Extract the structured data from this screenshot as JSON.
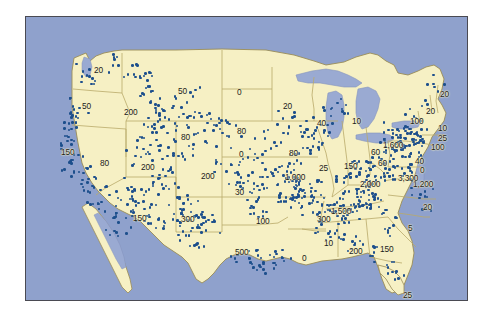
{
  "figure": {
    "type": "dot-distribution-map",
    "region": "Contiguous United States",
    "title": "",
    "dot_symbol_label": "",
    "colors": {
      "land": "#f6f0c4",
      "water": "#8fa1cc",
      "lake": "#9aaad2",
      "state_border": "#b9a96a",
      "coast_outline": "#9a8c57",
      "dot": "#1d4f8c",
      "frame": "#4a4a52",
      "background": "#ffffff"
    }
  },
  "chart_data": {
    "type": "map",
    "title": "",
    "xlabel": "",
    "ylabel": "",
    "legend": [],
    "grid": false,
    "categories": [
      "WA",
      "OR",
      "CA",
      "ID",
      "NV",
      "MT",
      "WY",
      "UT",
      "CO",
      "AZ",
      "NM",
      "ND",
      "SD",
      "NE",
      "KS",
      "OK",
      "TX",
      "MN",
      "IA",
      "MO",
      "AR",
      "LA",
      "WI",
      "IL",
      "MI",
      "IN",
      "OH",
      "KY",
      "TN",
      "MS",
      "AL",
      "GA",
      "FL",
      "SC",
      "NC",
      "VA",
      "WV",
      "PA",
      "NY",
      "ME",
      "VT-NH",
      "MA",
      "CT-RI",
      "NJ",
      "MD-DE"
    ],
    "values": [
      20,
      50,
      150,
      200,
      80,
      50,
      80,
      200,
      200,
      150,
      300,
      0,
      80,
      0,
      30,
      100,
      500,
      20,
      80,
      1000,
      300,
      0,
      40,
      150,
      10,
      60,
      60,
      1000,
      1500,
      10,
      200,
      150,
      25,
      5,
      1200,
      1200,
      1600,
      3300,
      2000,
      20,
      20,
      25,
      100,
      100,
      40
    ],
    "note": "Values are the printed per-state counts as rendered on the map."
  },
  "map_labels": [
    {
      "id": "label-wa",
      "text": "20",
      "x": 68,
      "y": 49
    },
    {
      "id": "label-or",
      "text": "50",
      "x": 56,
      "y": 85
    },
    {
      "id": "label-ca",
      "text": "150",
      "x": 35,
      "y": 131
    },
    {
      "id": "label-id",
      "text": "200",
      "x": 98,
      "y": 91
    },
    {
      "id": "label-mt",
      "text": "50",
      "x": 152,
      "y": 70
    },
    {
      "id": "label-nd",
      "text": "0",
      "x": 211,
      "y": 71
    },
    {
      "id": "label-wy",
      "text": "80",
      "x": 155,
      "y": 116
    },
    {
      "id": "label-sd",
      "text": "80",
      "x": 211,
      "y": 110
    },
    {
      "id": "label-ne",
      "text": "0",
      "x": 213,
      "y": 133
    },
    {
      "id": "label-nv",
      "text": "80",
      "x": 74,
      "y": 142
    },
    {
      "id": "label-ut",
      "text": "200",
      "x": 115,
      "y": 146
    },
    {
      "id": "label-co",
      "text": "200",
      "x": 175,
      "y": 155
    },
    {
      "id": "label-ks",
      "text": "30",
      "x": 209,
      "y": 171
    },
    {
      "id": "label-ok",
      "text": "100",
      "x": 230,
      "y": 200
    },
    {
      "id": "label-tx",
      "text": "500",
      "x": 209,
      "y": 231
    },
    {
      "id": "label-az",
      "text": "150",
      "x": 107,
      "y": 197
    },
    {
      "id": "label-nm",
      "text": "300",
      "x": 155,
      "y": 198
    },
    {
      "id": "label-mn",
      "text": "20",
      "x": 257,
      "y": 85
    },
    {
      "id": "label-wi",
      "text": "40",
      "x": 291,
      "y": 102
    },
    {
      "id": "label-mi",
      "text": "10",
      "x": 326,
      "y": 100
    },
    {
      "id": "label-ia",
      "text": "80",
      "x": 263,
      "y": 132
    },
    {
      "id": "label-mo",
      "text": "1,000",
      "x": 259,
      "y": 156
    },
    {
      "id": "label-il",
      "text": "150",
      "x": 318,
      "y": 145
    },
    {
      "id": "label-in",
      "text": "25",
      "x": 293,
      "y": 147
    },
    {
      "id": "label-oh",
      "text": "60",
      "x": 352,
      "y": 142
    },
    {
      "id": "label-ky",
      "text": "2,000",
      "x": 334,
      "y": 163
    },
    {
      "id": "label-tn",
      "text": "1,500",
      "x": 305,
      "y": 190
    },
    {
      "id": "label-ar",
      "text": "300",
      "x": 291,
      "y": 198
    },
    {
      "id": "label-la",
      "text": "0",
      "x": 276,
      "y": 237
    },
    {
      "id": "label-ms",
      "text": "10",
      "x": 298,
      "y": 222
    },
    {
      "id": "label-al",
      "text": "200",
      "x": 323,
      "y": 230
    },
    {
      "id": "label-ga",
      "text": "150",
      "x": 354,
      "y": 228
    },
    {
      "id": "label-sc",
      "text": "5",
      "x": 382,
      "y": 207
    },
    {
      "id": "label-fl",
      "text": "25",
      "x": 377,
      "y": 274
    },
    {
      "id": "label-nc",
      "text": "20",
      "x": 397,
      "y": 186
    },
    {
      "id": "label-va",
      "text": "1,200",
      "x": 387,
      "y": 163
    },
    {
      "id": "label-wv",
      "text": "3,300",
      "x": 372,
      "y": 157
    },
    {
      "id": "label-md",
      "text": "0",
      "x": 394,
      "y": 149
    },
    {
      "id": "label-de",
      "text": "40",
      "x": 389,
      "y": 140
    },
    {
      "id": "label-pa",
      "text": "1,600",
      "x": 357,
      "y": 124
    },
    {
      "id": "label-nj",
      "text": "100",
      "x": 405,
      "y": 126
    },
    {
      "id": "label-ct",
      "text": "25",
      "x": 412,
      "y": 117
    },
    {
      "id": "label-ny",
      "text": "100",
      "x": 384,
      "y": 100
    },
    {
      "id": "label-ma",
      "text": "10",
      "x": 412,
      "y": 107
    },
    {
      "id": "label-vtnh",
      "text": "20",
      "x": 400,
      "y": 90
    },
    {
      "id": "label-me",
      "text": "20",
      "x": 414,
      "y": 73
    },
    {
      "id": "label-oh2",
      "text": "60",
      "x": 345,
      "y": 131
    }
  ]
}
